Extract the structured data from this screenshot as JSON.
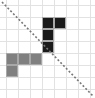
{
  "figure": {
    "title": "",
    "width": 95,
    "height": 98,
    "background_color": "#ffffff"
  },
  "grid": {
    "columns": 7,
    "rows": 7,
    "cell_size": 12,
    "origin_x": 6,
    "origin_y": 5,
    "line_color": "#e2e2e2",
    "line_width": 1
  },
  "diagonal": {
    "name": "dashed-diagonal",
    "color": "#777777",
    "width": 1.6,
    "dash_pattern": "2 2",
    "x1": 2,
    "y1": 2,
    "x2": 93,
    "y2": 96
  },
  "chart_data": {
    "type": "heatmap",
    "title": "",
    "xlabel": "",
    "ylabel": "",
    "grid": true,
    "columns": 7,
    "rows": 7,
    "cell_size": 12,
    "xlim": [
      0,
      7
    ],
    "ylim": [
      0,
      7
    ],
    "categories": [
      "c0",
      "c1",
      "c2",
      "c3",
      "c4",
      "c5",
      "c6"
    ],
    "tick_labels_x": [],
    "tick_labels_y": [],
    "legend": [],
    "palette": {
      "dark": "#1a1a1a",
      "gray": "#808080",
      "empty": "#ffffff",
      "outline": "#a8a8a8"
    },
    "cells": [
      {
        "col": 3,
        "row": 1,
        "fill": "dark"
      },
      {
        "col": 4,
        "row": 1,
        "fill": "dark"
      },
      {
        "col": 3,
        "row": 2,
        "fill": "dark"
      },
      {
        "col": 3,
        "row": 3,
        "fill": "dark"
      },
      {
        "col": 0,
        "row": 4,
        "fill": "gray"
      },
      {
        "col": 1,
        "row": 4,
        "fill": "gray"
      },
      {
        "col": 2,
        "row": 4,
        "fill": "gray"
      },
      {
        "col": 0,
        "row": 5,
        "fill": "gray"
      }
    ],
    "values": [
      [
        0,
        0,
        0,
        0,
        0,
        0,
        0
      ],
      [
        0,
        0,
        0,
        2,
        2,
        0,
        0
      ],
      [
        0,
        0,
        0,
        2,
        0,
        0,
        0
      ],
      [
        0,
        0,
        0,
        2,
        0,
        0,
        0
      ],
      [
        1,
        1,
        1,
        0,
        0,
        0,
        0
      ],
      [
        1,
        0,
        0,
        0,
        0,
        0,
        0
      ],
      [
        0,
        0,
        0,
        0,
        0,
        0,
        0
      ]
    ],
    "value_key": {
      "0": "empty",
      "1": "gray",
      "2": "dark"
    }
  }
}
